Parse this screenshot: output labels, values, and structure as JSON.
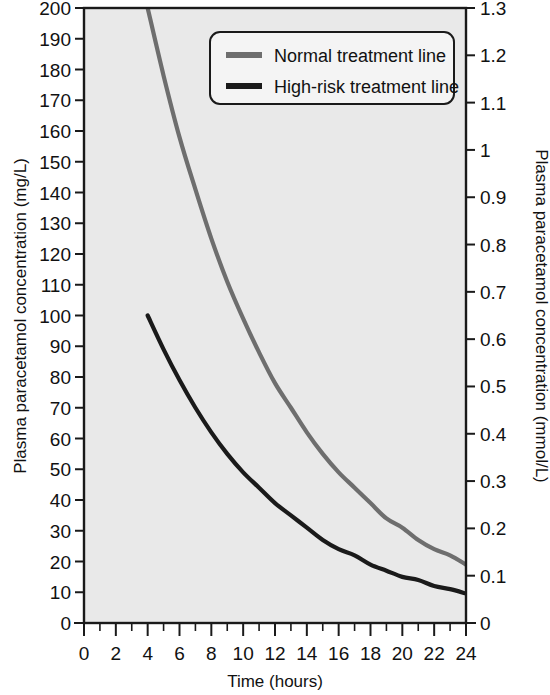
{
  "chart_data": {
    "type": "line",
    "title": "",
    "xlabel": "Time (hours)",
    "ylabel": "Plasma paracetamol concentration (mg/L)",
    "ylabel_right": "Plasma paracetamol concentration (mmol/L)",
    "xlim": [
      0,
      24
    ],
    "ylim": [
      0,
      200
    ],
    "ylim_right": [
      0,
      1.3
    ],
    "grid": false,
    "legend_position": "top-right-inside",
    "background_color": "#e9e9e9",
    "xticks": [
      0,
      2,
      4,
      6,
      8,
      10,
      12,
      14,
      16,
      18,
      20,
      22,
      24
    ],
    "xtick_labels": [
      "0",
      "2",
      "4",
      "6",
      "8",
      "10",
      "12",
      "14",
      "16",
      "18",
      "20",
      "22",
      "24"
    ],
    "x_minor_tick_step": 1,
    "yticks": [
      0,
      10,
      20,
      30,
      40,
      50,
      60,
      70,
      80,
      90,
      100,
      110,
      120,
      130,
      140,
      150,
      160,
      170,
      180,
      190,
      200
    ],
    "ytick_labels": [
      "0",
      "10",
      "20",
      "30",
      "40",
      "50",
      "60",
      "70",
      "80",
      "90",
      "100",
      "110",
      "120",
      "130",
      "140",
      "150",
      "160",
      "170",
      "180",
      "190",
      "200"
    ],
    "yticks_right": [
      0,
      0.1,
      0.2,
      0.3,
      0.4,
      0.5,
      0.6,
      0.7,
      0.8,
      0.9,
      1.0,
      1.1,
      1.2,
      1.3
    ],
    "ytick_labels_right": [
      "0",
      "0.1",
      "0.2",
      "0.3",
      "0.4",
      "0.5",
      "0.6",
      "0.7",
      "0.8",
      "0.9",
      "1",
      "1.1",
      "1.2",
      "1.3"
    ],
    "x": [
      4,
      5,
      6,
      7,
      8,
      9,
      10,
      11,
      12,
      13,
      14,
      15,
      16,
      17,
      18,
      19,
      20,
      21,
      22,
      23,
      24
    ],
    "series": [
      {
        "name": "Normal treatment line",
        "color": "#6e6e6e",
        "line_width": 4.2,
        "values": [
          200,
          178,
          158,
          141,
          125,
          111,
          99,
          88,
          78,
          70,
          62,
          55,
          49,
          44,
          39,
          34,
          31,
          27,
          24,
          22,
          19
        ]
      },
      {
        "name": "High-risk treatment line",
        "color": "#1a1a1a",
        "line_width": 4.2,
        "values": [
          100,
          89,
          79,
          70,
          62,
          55,
          49,
          44,
          39,
          35,
          31,
          27,
          24,
          22,
          19,
          17,
          15,
          14,
          12,
          11,
          9.6
        ]
      }
    ]
  },
  "legend": {
    "items": [
      {
        "label": "Normal treatment line",
        "color": "#6e6e6e"
      },
      {
        "label": "High-risk treatment line",
        "color": "#1a1a1a"
      }
    ]
  },
  "axes": {
    "x_title": "Time (hours)",
    "y_left_title": "Plasma paracetamol concentration (mg/L)",
    "y_right_title": "Plasma paracetamol concentration (mmol/L)"
  }
}
